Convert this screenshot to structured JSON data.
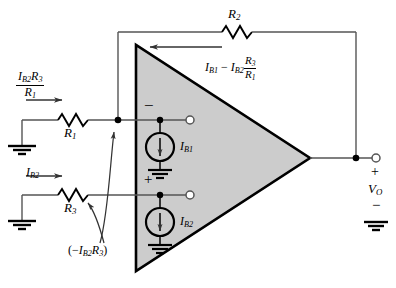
{
  "figure": {
    "kind": "op-amp bias-current circuit schematic",
    "accent_fill": "#cccccc",
    "line_color": "#000000",
    "wire_color": "#555555"
  },
  "components": {
    "r1_label": "R",
    "r1_sub": "1",
    "r2_label": "R",
    "r2_sub": "2",
    "r3_label": "R",
    "r3_sub": "3",
    "src1_label": "I",
    "src1_sub": "B1",
    "src2_label": "I",
    "src2_sub": "B2"
  },
  "annotations": {
    "input_drop": {
      "num_i": "I",
      "num_i_sub": "B2",
      "num_r": "R",
      "num_r_sub": "3",
      "den_r": "R",
      "den_r_sub": "1"
    },
    "feedback_current": {
      "i1": "I",
      "i1_sub": "B1",
      "minus": "−",
      "i2": "I",
      "i2_sub": "B2",
      "fr_num": "R",
      "fr_num_sub": "3",
      "fr_den": "R",
      "fr_den_sub": "1"
    },
    "ib2_arrow": {
      "i": "I",
      "i_sub": "B2"
    },
    "node_voltage": {
      "open": "(−",
      "i": "I",
      "i_sub": "B2",
      "r": "R",
      "r_sub": "3",
      "close": ")"
    },
    "inverting_sign": "−",
    "noninverting_sign": "+",
    "output_plus": "+",
    "output_minus": "−",
    "output_label": "V",
    "output_sub": "O"
  }
}
